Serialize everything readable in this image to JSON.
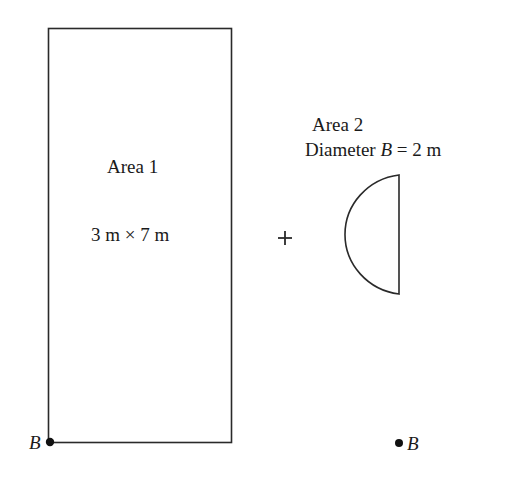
{
  "figure": {
    "stroke_color": "#2a2a2a",
    "background": "#ffffff",
    "area1": {
      "title": "Area 1",
      "dimensions": "3 m × 7 m",
      "shape": "rectangle"
    },
    "operator": "+",
    "area2": {
      "title": "Area 2",
      "diameter_prefix": "Diameter ",
      "diameter_var": "B",
      "diameter_suffix": " = 2 m",
      "shape": "semicircle"
    },
    "point_label_left": "B",
    "point_label_right": "B"
  }
}
